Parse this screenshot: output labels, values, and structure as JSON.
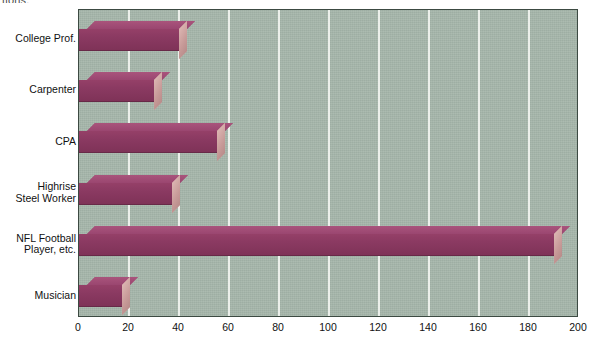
{
  "page": {
    "cropped_text_fragment": "tions."
  },
  "chart_data": {
    "type": "bar",
    "orientation": "horizontal",
    "title": "",
    "subtitle": "",
    "xlabel": "",
    "ylabel": "",
    "categories": [
      "College Prof.",
      "Carpenter",
      "CPA",
      "Highrise\nSteel Worker",
      "NFL Football\nPlayer, etc.",
      "Musician"
    ],
    "values": [
      40,
      30,
      55,
      37,
      190,
      17
    ],
    "xlim": [
      0,
      200
    ],
    "xticks": [
      0,
      20,
      40,
      60,
      80,
      100,
      120,
      140,
      160,
      180,
      200
    ],
    "xtick_labels": [
      "0",
      "20",
      "40",
      "60",
      "80",
      "100",
      "120",
      "140",
      "160",
      "180",
      "200"
    ],
    "grid": "vertical-major",
    "legend": "none",
    "style": "3d-bars",
    "colors": {
      "bar_front": "#8b3a62",
      "bar_top": "#9e4a71",
      "bar_side": "#cda4a2",
      "plot_background": "#a5b6aa",
      "gridline": "#f2f4f0",
      "axis_border": "#3c4a42",
      "text": "#111111",
      "page_background": "#ffffff"
    }
  }
}
